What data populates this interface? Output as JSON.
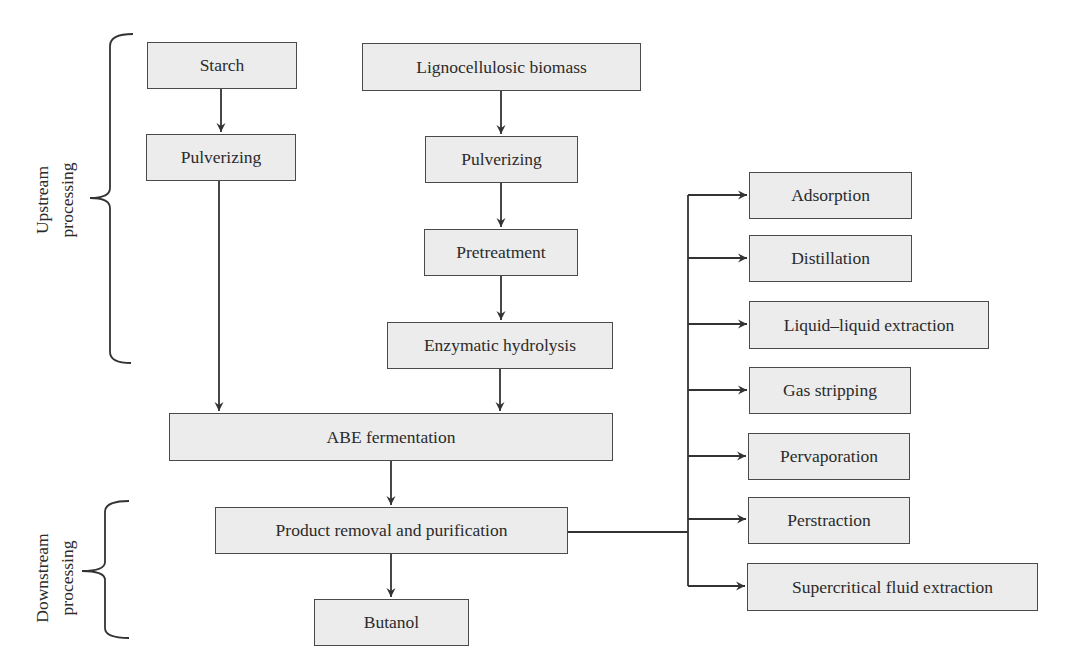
{
  "diagram": {
    "colors": {
      "box_fill": "#ececec",
      "box_border": "#4a4a4a",
      "line": "#333333",
      "text": "#2b2b2b"
    },
    "stage_labels": {
      "upstream": {
        "line1": "Upstream",
        "line2": "processing"
      },
      "downstream": {
        "line1": "Downstream",
        "line2": "processing"
      }
    },
    "nodes": {
      "starch": "Starch",
      "pulverizing_starch": "Pulverizing",
      "lignocellulosic": "Lignocellulosic biomass",
      "pulverizing_ligno": "Pulverizing",
      "pretreatment": "Pretreatment",
      "enzymatic_hydrolysis": "Enzymatic hydrolysis",
      "abe_fermentation": "ABE fermentation",
      "product_removal": "Product removal and purification",
      "butanol": "Butanol"
    },
    "separation_methods": [
      {
        "label": "Adsorption"
      },
      {
        "label": "Distillation"
      },
      {
        "label": "Liquid–liquid extraction"
      },
      {
        "label": "Gas stripping"
      },
      {
        "label": "Pervaporation"
      },
      {
        "label": "Perstraction"
      },
      {
        "label": "Supercritical fluid extraction"
      }
    ],
    "edges": [
      [
        "starch",
        "pulverizing_starch"
      ],
      [
        "pulverizing_starch",
        "abe_fermentation"
      ],
      [
        "lignocellulosic",
        "pulverizing_ligno"
      ],
      [
        "pulverizing_ligno",
        "pretreatment"
      ],
      [
        "pretreatment",
        "enzymatic_hydrolysis"
      ],
      [
        "enzymatic_hydrolysis",
        "abe_fermentation"
      ],
      [
        "abe_fermentation",
        "product_removal"
      ],
      [
        "product_removal",
        "butanol"
      ],
      [
        "product_removal",
        "separation_methods"
      ]
    ]
  }
}
